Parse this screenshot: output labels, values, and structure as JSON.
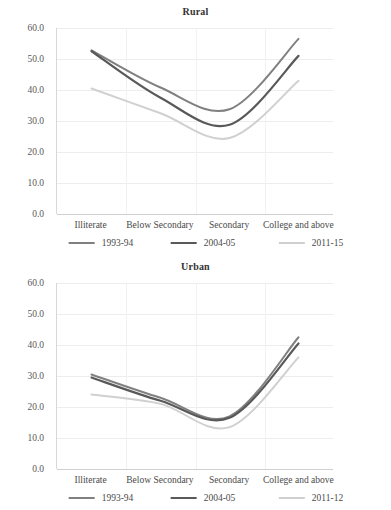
{
  "clipped_top_legend": {
    "visible": true,
    "items": [
      "1993-94",
      "2004-05",
      "2011-12"
    ]
  },
  "y_axis": {
    "ticks": [
      "0.0",
      "10.0",
      "20.0",
      "30.0",
      "40.0",
      "50.0",
      "60.0"
    ],
    "min": 0,
    "max": 60,
    "step": 10
  },
  "x_axis": {
    "categories": [
      "Illiterate",
      "Below Secondary",
      "Secondary",
      "College and above"
    ]
  },
  "colors": {
    "series_1993_94": "#808080",
    "series_2004_05": "#595959",
    "series_2011": "#d0d0d0",
    "gridline": "#ededed",
    "axis": "#d0d0d0",
    "text": "#4a4a4a"
  },
  "charts": [
    {
      "key": "rural",
      "title": "Rural",
      "legend": [
        "1993-94",
        "2004-05",
        "2011-15"
      ]
    },
    {
      "key": "urban",
      "title": "Urban",
      "legend": [
        "1993-94",
        "2004-05",
        "2011-12"
      ]
    }
  ],
  "chart_data": [
    {
      "type": "line",
      "title": "Rural",
      "xlabel": "",
      "ylabel": "",
      "categories": [
        "Illiterate",
        "Below Secondary",
        "Secondary",
        "College and above"
      ],
      "ylim": [
        0,
        60
      ],
      "ytick_step": 10,
      "grid": true,
      "legend_position": "bottom",
      "series": [
        {
          "name": "1993-94",
          "color": "#808080",
          "width": 2.0,
          "values": [
            52.8,
            40.8,
            33.8,
            56.5
          ]
        },
        {
          "name": "2004-05",
          "color": "#595959",
          "width": 2.2,
          "values": [
            52.5,
            37.5,
            28.8,
            51.0
          ]
        },
        {
          "name": "2011-15",
          "color": "#d0d0d0",
          "width": 2.0,
          "values": [
            40.5,
            32.5,
            24.5,
            43.0
          ]
        }
      ]
    },
    {
      "type": "line",
      "title": "Urban",
      "xlabel": "",
      "ylabel": "",
      "categories": [
        "Illiterate",
        "Below Secondary",
        "Secondary",
        "College and above"
      ],
      "ylim": [
        0,
        60
      ],
      "ytick_step": 10,
      "grid": true,
      "legend_position": "bottom",
      "series": [
        {
          "name": "1993-94",
          "color": "#808080",
          "width": 2.0,
          "values": [
            30.5,
            23.0,
            17.0,
            42.5
          ]
        },
        {
          "name": "2004-05",
          "color": "#595959",
          "width": 2.2,
          "values": [
            29.5,
            22.0,
            16.5,
            40.5
          ]
        },
        {
          "name": "2011-12",
          "color": "#d0d0d0",
          "width": 2.0,
          "values": [
            24.0,
            21.0,
            13.5,
            36.0
          ]
        }
      ]
    }
  ]
}
